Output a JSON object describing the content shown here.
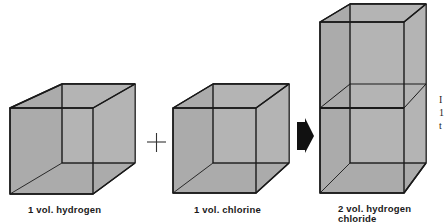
{
  "diagram": {
    "operators": {
      "plus": "+",
      "yields": "arrow-right"
    },
    "colors": {
      "fill": "#a9a9a9",
      "fill_back": "#b6b6b6",
      "stroke": "#1a1a1a",
      "arrow": "#111111",
      "background": "#ffffff"
    },
    "boxes": [
      {
        "id": "hydrogen",
        "label": "1 vol. hydrogen",
        "volumes": 1
      },
      {
        "id": "chlorine",
        "label": "1 vol. chlorine",
        "volumes": 1
      },
      {
        "id": "hydrogen-chloride",
        "label_line1": "2 vol. hydrogen",
        "label_line2": "chloride",
        "volumes": 2
      }
    ],
    "clipped_edge_text": [
      "I",
      "1",
      "t"
    ]
  }
}
